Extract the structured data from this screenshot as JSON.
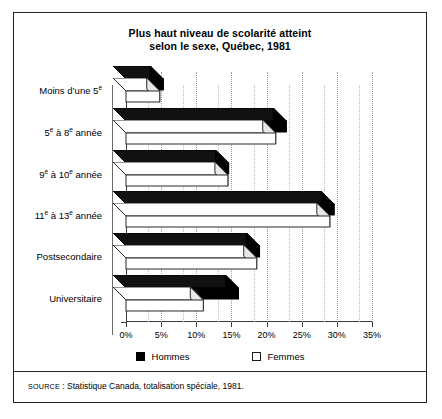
{
  "chart_data": {
    "type": "bar",
    "orientation": "horizontal",
    "title": "Plus haut niveau de scolarité atteint selon le sexe, Québec, 1981",
    "title_line1": "Plus haut niveau de scolarité atteint",
    "title_line2": "selon le sexe, Québec, 1981",
    "categories": [
      "Moins d'une 5e",
      "5e à 8e année",
      "9e à 10e année",
      "11e à 13e année",
      "Postsecondaire",
      "Universitaire"
    ],
    "series": [
      {
        "name": "Hommes",
        "color": "#000000",
        "values": [
          5.3,
          22.8,
          14.6,
          29.6,
          19.0,
          16.0
        ]
      },
      {
        "name": "Femmes",
        "color": "#ffffff",
        "values": [
          4.8,
          21.3,
          14.5,
          29.0,
          18.6,
          11.0
        ]
      }
    ],
    "xlabel": "",
    "ylabel": "",
    "xlim": [
      0,
      35
    ],
    "xticks": [
      0,
      5,
      10,
      15,
      20,
      25,
      30,
      35
    ],
    "xtick_labels": [
      "0%",
      "5%",
      "10%",
      "15%",
      "20%",
      "25%",
      "30%",
      "35%"
    ],
    "grid": true,
    "grid_style": "dotted-vertical",
    "legend_position": "bottom",
    "legend": [
      "Hommes",
      "Femmes"
    ],
    "style": "3d-bar"
  },
  "source": {
    "label": "SOURCE",
    "text": " : Statistique Canada, totalisation spéciale, 1981."
  }
}
